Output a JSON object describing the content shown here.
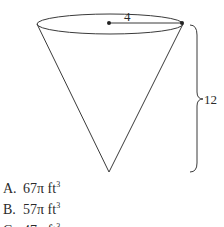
{
  "figure": {
    "shape": "inverted cone",
    "radius_label": "4",
    "height_label": "12",
    "stroke_color": "#3a3a3a"
  },
  "choices": [
    {
      "letter": "A.",
      "value": "67π ft",
      "exp": "3"
    },
    {
      "letter": "B.",
      "value": "57π ft",
      "exp": "3"
    },
    {
      "letter": "C.",
      "value": "47π ft",
      "exp": "3"
    }
  ]
}
